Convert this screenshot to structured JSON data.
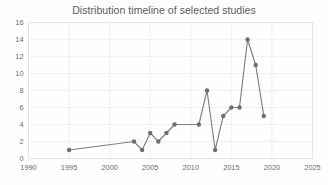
{
  "chart_data": {
    "type": "line",
    "title": "Distribution timeline of selected studies",
    "xlabel": "",
    "ylabel": "",
    "x": [
      1995,
      2003,
      2004,
      2005,
      2006,
      2007,
      2008,
      2011,
      2012,
      2013,
      2014,
      2015,
      2016,
      2017,
      2018,
      2019
    ],
    "values": [
      1,
      2,
      1,
      3,
      2,
      3,
      4,
      4,
      8,
      1,
      5,
      6,
      6,
      14,
      11,
      5
    ],
    "series": [
      {
        "name": "Number of studies",
        "values": [
          1,
          2,
          1,
          3,
          2,
          3,
          4,
          4,
          8,
          1,
          5,
          6,
          6,
          14,
          11,
          5
        ]
      }
    ],
    "xlim": [
      1990,
      2025
    ],
    "ylim": [
      0,
      16
    ],
    "xticks": [
      1990,
      1995,
      2000,
      2005,
      2010,
      2015,
      2020,
      2025
    ],
    "yticks": [
      0,
      2,
      4,
      6,
      8,
      10,
      12,
      14,
      16
    ],
    "grid": true,
    "legend": false,
    "legend_position": "none",
    "line_color": "#7f7f7f",
    "marker_color": "#6e6e6e",
    "marker": "circle",
    "gridline_color": "#ededed",
    "title_color": "#5a5a5a",
    "tick_color": "#6b6b6b"
  }
}
